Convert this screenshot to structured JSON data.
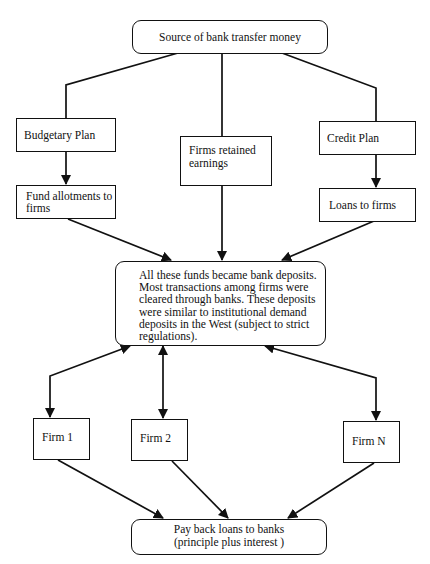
{
  "diagram": {
    "nodes": {
      "source": {
        "label": "Source of bank transfer money"
      },
      "budgetary_plan": {
        "label": "Budgetary Plan"
      },
      "retained_earnings": {
        "label": "Firms retained\nearnings"
      },
      "credit_plan": {
        "label": "Credit Plan"
      },
      "fund_allotments": {
        "label": "Fund allotments to\nfirms"
      },
      "loans_to_firms": {
        "label": "Loans to firms"
      },
      "bank_deposits": {
        "label": "All these funds became bank deposits.\nMost transactions  among firms were\ncleared through banks. These deposits\nwere similar to institutional demand\ndeposits in the West (subject to strict\nregulations)."
      },
      "firm_1": {
        "label": "Firm 1"
      },
      "firm_2": {
        "label": "Firm 2"
      },
      "firm_n": {
        "label": "Firm N"
      },
      "pay_back": {
        "line1": "Pay back loans to banks",
        "line2": "(principle plus interest )"
      }
    },
    "edges": [
      {
        "from": "source",
        "to": "budgetary_plan",
        "arrow": "none"
      },
      {
        "from": "source",
        "to": "retained_earnings",
        "arrow": "none"
      },
      {
        "from": "source",
        "to": "credit_plan",
        "arrow": "none"
      },
      {
        "from": "budgetary_plan",
        "to": "fund_allotments",
        "arrow": "forward"
      },
      {
        "from": "credit_plan",
        "to": "loans_to_firms",
        "arrow": "forward"
      },
      {
        "from": "fund_allotments",
        "to": "bank_deposits",
        "arrow": "forward"
      },
      {
        "from": "retained_earnings",
        "to": "bank_deposits",
        "arrow": "forward"
      },
      {
        "from": "loans_to_firms",
        "to": "bank_deposits",
        "arrow": "forward"
      },
      {
        "from": "bank_deposits",
        "to": "firm_1",
        "arrow": "both"
      },
      {
        "from": "bank_deposits",
        "to": "firm_2",
        "arrow": "both"
      },
      {
        "from": "bank_deposits",
        "to": "firm_n",
        "arrow": "both"
      },
      {
        "from": "firm_1",
        "to": "pay_back",
        "arrow": "forward"
      },
      {
        "from": "firm_2",
        "to": "pay_back",
        "arrow": "forward"
      },
      {
        "from": "firm_n",
        "to": "pay_back",
        "arrow": "forward"
      }
    ],
    "colors": {
      "stroke": "#111111",
      "background": "#ffffff"
    }
  }
}
